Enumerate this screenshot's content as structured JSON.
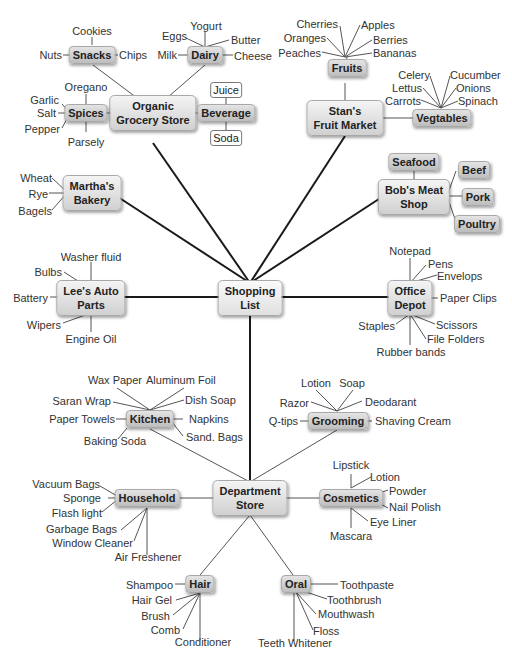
{
  "title": "Shopping List",
  "nodes": {
    "root": {
      "label_1": "Shopping",
      "label_2": "List"
    },
    "organic": {
      "label_1": "Organic",
      "label_2": "Grocery Store"
    },
    "stans": {
      "label_1": "Stan's",
      "label_2": "Fruit Market"
    },
    "marthas": {
      "label_1": "Martha's",
      "label_2": "Bakery"
    },
    "bobs": {
      "label_1": "Bob's Meat",
      "label_2": "Shop"
    },
    "lees": {
      "label_1": "Lee's Auto",
      "label_2": "Parts"
    },
    "office": {
      "label_1": "Office",
      "label_2": "Depot"
    },
    "dept": {
      "label_1": "Department",
      "label_2": "Store"
    },
    "snacks": {
      "label": "Snacks"
    },
    "dairy": {
      "label": "Dairy"
    },
    "spices": {
      "label": "Spices"
    },
    "beverage": {
      "label": "Beverage"
    },
    "juice": {
      "label": "Juice"
    },
    "soda": {
      "label": "Soda"
    },
    "fruits": {
      "label": "Fruits"
    },
    "vegtables": {
      "label": "Vegtables"
    },
    "seafood": {
      "label": "Seafood"
    },
    "beef": {
      "label": "Beef"
    },
    "pork": {
      "label": "Pork"
    },
    "poultry": {
      "label": "Poultry"
    },
    "kitchen": {
      "label": "Kitchen"
    },
    "grooming": {
      "label": "Grooming"
    },
    "household": {
      "label": "Household"
    },
    "cosmetics": {
      "label": "Cosmetics"
    },
    "hair": {
      "label": "Hair"
    },
    "oral": {
      "label": "Oral"
    }
  },
  "leaves": {
    "snacks": [
      "Cookies",
      "Nuts",
      "Chips"
    ],
    "dairy": [
      "Eggs",
      "Yogurt",
      "Butter",
      "Milk",
      "Cheese"
    ],
    "spices": [
      "Oregano",
      "Garlic",
      "Salt",
      "Pepper",
      "Parsely"
    ],
    "fruits": [
      "Cherries",
      "Apples",
      "Oranges",
      "Berries",
      "Peaches",
      "Bananas"
    ],
    "vegtables": [
      "Celery",
      "Cucumber",
      "Lettus",
      "Onions",
      "Carrots",
      "Spinach"
    ],
    "bakery": [
      "Wheat",
      "Rye",
      "Bagels"
    ],
    "auto": [
      "Washer fluid",
      "Bulbs",
      "Battery",
      "Wipers",
      "Engine Oil"
    ],
    "office": [
      "Notepad",
      "Pens",
      "Envelops",
      "Paper Clips",
      "Staples",
      "Scissors",
      "File Folders",
      "Rubber bands"
    ],
    "kitchen": [
      "Wax Paper",
      "Aluminum Foil",
      "Saran Wrap",
      "Dish Soap",
      "Paper Towels",
      "Napkins",
      "Baking Soda",
      "Sand. Bags"
    ],
    "grooming": [
      "Lotion",
      "Soap",
      "Razor",
      "Deodarant",
      "Q-tips",
      "Shaving Cream"
    ],
    "household": [
      "Vacuum Bags",
      "Sponge",
      "Flash light",
      "Garbage Bags",
      "Window Cleaner",
      "Air Freshener"
    ],
    "cosmetics": [
      "Lipstick",
      "Lotion",
      "Powder",
      "Nail Polish",
      "Eye Liner",
      "Mascara"
    ],
    "hair": [
      "Shampoo",
      "Hair Gel",
      "Brush",
      "Comb",
      "Conditioner"
    ],
    "oral": [
      "Toothpaste",
      "Toothbrush",
      "Mouthwash",
      "Floss",
      "Teeth Whitener"
    ]
  },
  "colors": {
    "line_main": "#1a1a1a",
    "line_thin": "#555555",
    "node_top": "#f4f4f4",
    "node_bottom": "#d0d0d0",
    "text": "#222222"
  }
}
